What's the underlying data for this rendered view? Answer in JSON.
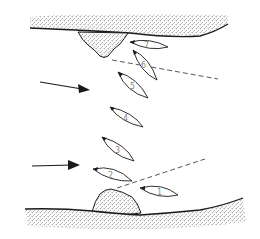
{
  "diagram": {
    "type": "river-navigation-diagram",
    "colors": {
      "ink": "#1a1a1a",
      "stipple": "#8a8a8a",
      "dashed": "#444444",
      "label": "#888888"
    },
    "banks": [
      {
        "id": "top-bank",
        "label": ""
      },
      {
        "id": "bottom-bank",
        "label": ""
      }
    ],
    "rocks": [
      {
        "id": "top-rock",
        "position": "upper bank"
      },
      {
        "id": "bottom-rock",
        "position": "lower bank"
      }
    ],
    "current_arrows": [
      {
        "id": "arrow-upper",
        "direction": "right-downward"
      },
      {
        "id": "arrow-lower",
        "direction": "right"
      }
    ],
    "boats": [
      {
        "number": "1"
      },
      {
        "number": "2"
      },
      {
        "number": "3"
      },
      {
        "number": "4"
      },
      {
        "number": "5"
      },
      {
        "number": "6"
      },
      {
        "number": "7"
      }
    ],
    "dashed_lines": [
      {
        "id": "upper-alignment-line"
      },
      {
        "id": "lower-alignment-line"
      }
    ]
  }
}
